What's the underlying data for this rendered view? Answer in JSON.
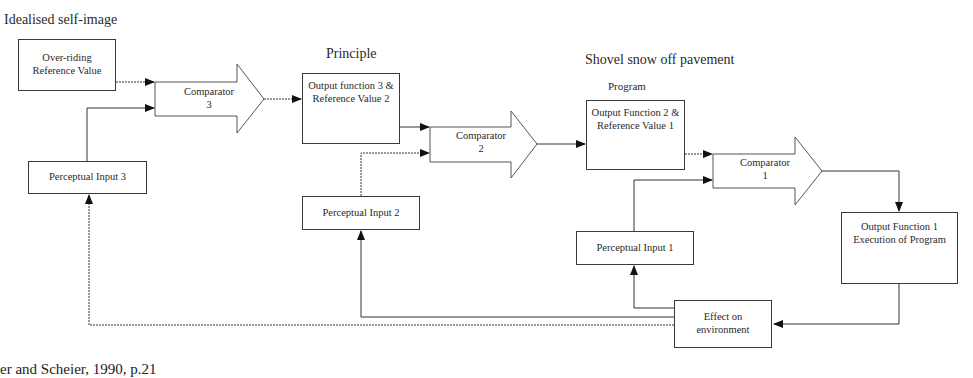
{
  "labels": {
    "idealised": "Idealised self-image",
    "principle": "Principle",
    "shovel": "Shovel snow off pavement",
    "program": "Program"
  },
  "boxes": {
    "overriding": "Over-riding Reference Value",
    "perceptual3": "Perceptual Input 3",
    "output3": "Output function 3 & Reference Value 2",
    "perceptual2": "Perceptual Input 2",
    "output2": "Output Function 2 & Reference Value 1",
    "perceptual1": "Perceptual Input 1",
    "output1": "Output Function 1 Execution of Program",
    "environment": "Effect on environment"
  },
  "comparators": {
    "c3": {
      "name": "Comparator",
      "num": "3"
    },
    "c2": {
      "name": "Comparator",
      "num": "2"
    },
    "c1": {
      "name": "Comparator",
      "num": "1"
    }
  },
  "caption": "er and Scheier, 1990, p.21"
}
